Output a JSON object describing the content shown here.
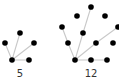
{
  "colors": {
    "background": "#ffffff",
    "node": "#000000",
    "edge": "#c8c8c8",
    "label": "#333333"
  },
  "graphs": [
    {
      "label": "5",
      "label_pos": [
        20,
        69
      ],
      "node_radius": 2.8,
      "nodes": [
        {
          "id": "hub",
          "x": 12,
          "y": 60
        },
        {
          "id": "top",
          "x": 20,
          "y": 33
        },
        {
          "id": "left",
          "x": 5,
          "y": 43
        },
        {
          "id": "right",
          "x": 34,
          "y": 43
        },
        {
          "id": "bottom-right",
          "x": 29,
          "y": 60
        }
      ],
      "edges": [
        [
          "hub",
          "top"
        ],
        [
          "hub",
          "left"
        ],
        [
          "hub",
          "right"
        ],
        [
          "hub",
          "bottom-right"
        ]
      ]
    },
    {
      "label": "12",
      "label_pos": [
        91,
        69
      ],
      "node_radius": 2.8,
      "note": "11 nodes are visible; the label reads 12",
      "nodes": [
        {
          "id": "hub",
          "x": 75,
          "y": 60
        },
        {
          "id": "top",
          "x": 91,
          "y": 7
        },
        {
          "id": "upper-left",
          "x": 77,
          "y": 16
        },
        {
          "id": "upper-right",
          "x": 105,
          "y": 16
        },
        {
          "id": "far-left",
          "x": 62,
          "y": 27
        },
        {
          "id": "mid-left",
          "x": 83,
          "y": 33
        },
        {
          "id": "right-edge",
          "x": 118,
          "y": 27
        },
        {
          "id": "lower-left",
          "x": 68,
          "y": 43
        },
        {
          "id": "center-right",
          "x": 96,
          "y": 43
        },
        {
          "id": "far-right",
          "x": 113,
          "y": 43
        },
        {
          "id": "bottom-mid",
          "x": 91,
          "y": 60
        },
        {
          "id": "bottom-right",
          "x": 107,
          "y": 60
        }
      ],
      "edges": [
        [
          "hub",
          "mid-left"
        ],
        [
          "mid-left",
          "top"
        ],
        [
          "hub",
          "lower-left"
        ],
        [
          "lower-left",
          "far-left"
        ],
        [
          "hub",
          "center-right"
        ],
        [
          "center-right",
          "right-edge"
        ],
        [
          "hub",
          "bottom-mid"
        ],
        [
          "bottom-mid",
          "bottom-right"
        ]
      ]
    }
  ]
}
